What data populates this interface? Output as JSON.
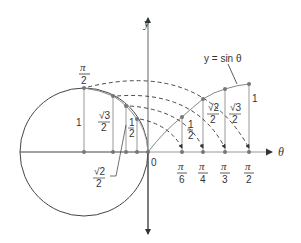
{
  "diagram": {
    "title": "",
    "curve_label": "y = sin θ",
    "axes": {
      "y_label": "y",
      "x_label": "θ",
      "origin_label": "0"
    },
    "circle_heights": [
      {
        "value": "1",
        "angle": "π/2"
      },
      {
        "value": "√3/2",
        "angle": "π/3"
      },
      {
        "value": "√2/2",
        "angle": "π/4"
      },
      {
        "value": "1/2",
        "angle": "π/6"
      }
    ],
    "curve_heights": [
      {
        "value": "1/2",
        "angle": "π/6"
      },
      {
        "value": "√2/2",
        "angle": "π/4"
      },
      {
        "value": "√3/2",
        "angle": "π/3"
      },
      {
        "value": "1",
        "angle": "π/2"
      }
    ],
    "top_label": {
      "num": "π",
      "den": "2"
    },
    "ticks": [
      {
        "num": "π",
        "den": "6"
      },
      {
        "num": "π",
        "den": "4"
      },
      {
        "num": "π",
        "den": "3"
      },
      {
        "num": "π",
        "den": "2"
      }
    ],
    "left_labels": {
      "one": "1",
      "sqrt3_num": "√3",
      "sqrt3_den": "2",
      "half_num": "1",
      "half_den": "2",
      "sqrt2_num": "√2",
      "sqrt2_den": "2"
    },
    "right_labels": {
      "half_num": "1",
      "half_den": "2",
      "sqrt2_num": "√2",
      "sqrt2_den": "2",
      "sqrt3_num": "√3",
      "sqrt3_den": "2",
      "one": "1"
    },
    "colors": {
      "line": "#333333",
      "gray": "#888888",
      "point": "#777777"
    }
  }
}
